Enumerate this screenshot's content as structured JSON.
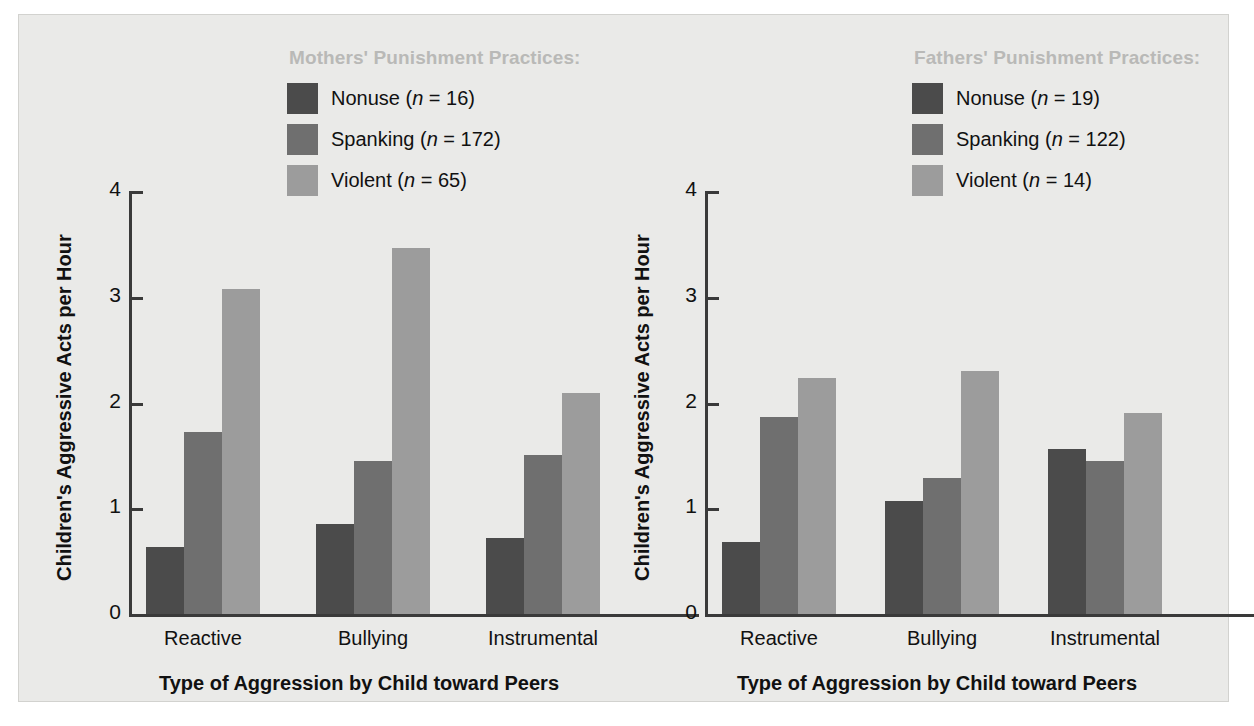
{
  "chart_data": [
    {
      "type": "bar",
      "panel_id": "mothers",
      "title": "Mothers' Punishment Practices:",
      "xlabel": "Type of Aggression by Child toward Peers",
      "ylabel": "Children's Aggressive Acts per Hour",
      "categories": [
        "Reactive",
        "Bullying",
        "Instrumental"
      ],
      "ylim": [
        0,
        4
      ],
      "yticks": [
        "0",
        "1",
        "2",
        "3",
        "4"
      ],
      "grid": false,
      "legend_position": "top-center",
      "series": [
        {
          "name": "Nonuse",
          "n": "16",
          "legend_label": "Nonuse (n = 16)",
          "color": "#4b4b4b",
          "values": [
            0.63,
            0.85,
            0.72
          ]
        },
        {
          "name": "Spanking",
          "n": "172",
          "legend_label": "Spanking (n = 172)",
          "color": "#6f6f6f",
          "values": [
            1.72,
            1.45,
            1.5
          ]
        },
        {
          "name": "Violent",
          "n": "65",
          "legend_label": "Violent (n = 65)",
          "color": "#9c9c9c",
          "values": [
            3.07,
            3.46,
            2.09
          ]
        }
      ]
    },
    {
      "type": "bar",
      "panel_id": "fathers",
      "title": "Fathers' Punishment Practices:",
      "xlabel": "Type of Aggression by Child toward Peers",
      "ylabel": "Children's Aggressive Acts per Hour",
      "categories": [
        "Reactive",
        "Bullying",
        "Instrumental"
      ],
      "ylim": [
        0,
        4
      ],
      "yticks": [
        "0",
        "1",
        "2",
        "3",
        "4"
      ],
      "grid": false,
      "legend_position": "top-center",
      "series": [
        {
          "name": "Nonuse",
          "n": "19",
          "legend_label": "Nonuse (n = 19)",
          "color": "#4b4b4b",
          "values": [
            0.68,
            1.07,
            1.56
          ]
        },
        {
          "name": "Spanking",
          "n": "122",
          "legend_label": "Spanking (n = 122)",
          "color": "#6f6f6f",
          "values": [
            1.86,
            1.29,
            1.45
          ]
        },
        {
          "name": "Violent",
          "n": "14",
          "legend_label": "Violent (n = 14)",
          "color": "#9c9c9c",
          "values": [
            2.23,
            2.3,
            1.9
          ]
        }
      ]
    }
  ],
  "legends": {
    "mothers": {
      "title": "Mothers' Punishment Practices:",
      "items": [
        {
          "label_main": "Nonuse (",
          "italic": "n",
          "label_tail": " = 16)",
          "color": "#4b4b4b"
        },
        {
          "label_main": "Spanking (",
          "italic": "n",
          "label_tail": " = 172)",
          "color": "#6f6f6f"
        },
        {
          "label_main": "Violent (",
          "italic": "n",
          "label_tail": " = 65)",
          "color": "#9c9c9c"
        }
      ]
    },
    "fathers": {
      "title": "Fathers' Punishment Practices:",
      "items": [
        {
          "label_main": "Nonuse (",
          "italic": "n",
          "label_tail": " = 19)",
          "color": "#4b4b4b"
        },
        {
          "label_main": "Spanking (",
          "italic": "n",
          "label_tail": " = 122)",
          "color": "#6f6f6f"
        },
        {
          "label_main": "Violent (",
          "italic": "n",
          "label_tail": " = 14)",
          "color": "#9c9c9c"
        }
      ]
    }
  },
  "colors": {
    "background": "#eaeae8",
    "axis": "#3a3a3a",
    "text": "#111111",
    "legend_title": "#b9b9b7",
    "nonuse": "#4b4b4b",
    "spanking": "#6f6f6f",
    "violent": "#9c9c9c"
  }
}
